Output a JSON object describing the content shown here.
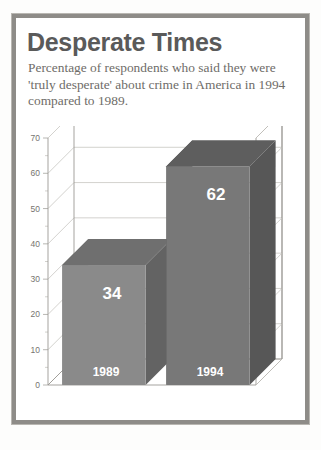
{
  "card": {
    "title": "Desperate Times",
    "subtitle": "Percentage of respondents who said they were 'truly desperate' about crime in America in 1994 compared to 1989."
  },
  "colors": {
    "frame_border": "#8e8c88",
    "title_text": "#5a5a5a",
    "subtitle_text": "#6e6c68",
    "bar_1989_front": "#8a8a8a",
    "bar_1989_top": "#6f6f6f",
    "bar_1989_side": "#636363",
    "bar_1994_front": "#787878",
    "bar_1994_top": "#5e5e5e",
    "bar_1994_side": "#575757",
    "gridline": "#c8c6c1",
    "axis_text": "#76746f",
    "value_label": "#ffffff"
  },
  "chart_data": {
    "type": "bar",
    "title": "Desperate Times",
    "subtitle": "Percentage of respondents who said they were 'truly desperate' about crime in America in 1994 compared to 1989.",
    "categories": [
      "1989",
      "1994"
    ],
    "values": [
      34,
      62
    ],
    "data_labels": [
      "34",
      "62"
    ],
    "xlabel": "",
    "ylabel": "",
    "ylim": [
      0,
      70
    ],
    "ytick_labels": [
      "0",
      "10",
      "20",
      "30",
      "40",
      "50",
      "60",
      "70"
    ],
    "ytick_values": [
      0,
      10,
      20,
      30,
      40,
      50,
      60,
      70
    ],
    "minor_tick_step": 5,
    "grid": true,
    "legend": false,
    "style": "3d-column"
  }
}
